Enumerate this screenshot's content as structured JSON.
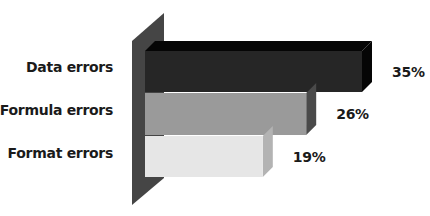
{
  "chart_data": {
    "type": "bar",
    "orientation": "horizontal",
    "style": "3d",
    "title": "",
    "xlabel": "",
    "ylabel": "",
    "categories": [
      "Data errors",
      "Formula errors",
      "Format errors"
    ],
    "values": [
      35,
      26,
      19
    ],
    "value_labels": [
      "35%",
      "26%",
      "19%"
    ],
    "unit": "%",
    "xlim": [
      0,
      35
    ],
    "grid": false,
    "legend": "none",
    "colors": {
      "bars": [
        "#262626",
        "#9a9a9a",
        "#e6e6e6"
      ],
      "bar_sides": [
        "#050505",
        "#4a4a4a",
        "#b3b3b3"
      ],
      "bar_tops": [
        "#050505",
        "#7a7a7a",
        "#c8c8c8"
      ],
      "wall": "#444444"
    }
  }
}
